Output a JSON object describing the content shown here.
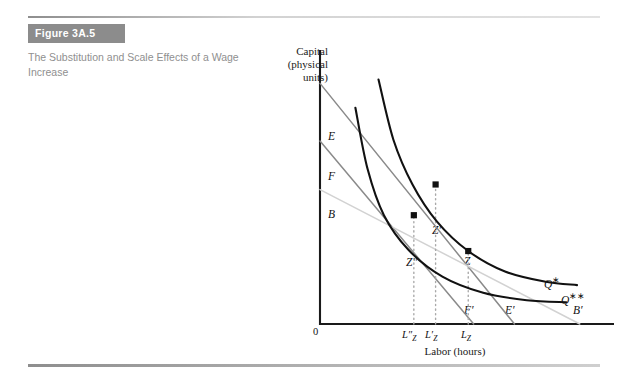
{
  "figure": {
    "badge": "Figure 3A.5",
    "caption": "The Substitution and Scale Effects of a Wage Increase"
  },
  "chart_data": {
    "type": "line",
    "title": "The Substitution and Scale Effects of a Wage Increase",
    "ylabel": "Capital\n(physical\nunits)",
    "ylabel_line1": "Capital",
    "ylabel_line2": "(physical",
    "ylabel_line3": "units)",
    "xlabel": "Labor (hours)",
    "origin_label": "0",
    "grid": false,
    "legend": "none",
    "axis_intercept_labels": [
      {
        "name": "E",
        "label": "E",
        "axis": "capital",
        "note": "highest isocost vertical intercept"
      },
      {
        "name": "F",
        "label": "F",
        "axis": "capital",
        "note": "middle isocost vertical intercept"
      },
      {
        "name": "B",
        "label": "B",
        "axis": "capital",
        "note": "flattest isocost vertical intercept"
      },
      {
        "name": "F-prime",
        "label": "F′",
        "axis": "labor",
        "note": "middle isocost horizontal intercept"
      },
      {
        "name": "E-prime",
        "label": "E′",
        "axis": "labor",
        "note": "highest isocost horizontal intercept"
      },
      {
        "name": "B-prime",
        "label": "B′",
        "axis": "labor",
        "note": "flattest isocost horizontal intercept"
      }
    ],
    "isoquant_labels": [
      {
        "name": "Q-star",
        "label": "Q✱",
        "text": "Q",
        "star": "∗",
        "note": "original isoquant"
      },
      {
        "name": "Q-double-star",
        "label": "Q✱✱",
        "text": "Q",
        "star": "∗∗",
        "note": "lower isoquant after scale effect"
      }
    ],
    "equilibrium_points": [
      {
        "name": "Z",
        "label": "Z",
        "labor": "L_Z",
        "note": "original cost-minimizing point on Q*"
      },
      {
        "name": "Z-prime",
        "label": "Z′",
        "labor": "L′_Z",
        "note": "substitution-effect point on Q*"
      },
      {
        "name": "Z-double-prime",
        "label": "Z″",
        "labor": "L″_Z",
        "note": "final point on Q**"
      }
    ],
    "x_tick_labels": [
      {
        "name": "L-double-prime-Z",
        "base": "L″",
        "sub": "Z"
      },
      {
        "name": "L-prime-Z",
        "base": "L′",
        "sub": "Z"
      },
      {
        "name": "L-Z",
        "base": "L",
        "sub": "Z"
      }
    ],
    "series": [
      {
        "name": "isoquant-Q-star",
        "label": "Q∗",
        "kind": "isoquant",
        "color": "#111111",
        "points": [
          [
            0.215,
            0.955
          ],
          [
            0.27,
            0.72
          ],
          [
            0.34,
            0.545
          ],
          [
            0.43,
            0.4
          ],
          [
            0.545,
            0.285
          ],
          [
            0.68,
            0.205
          ],
          [
            0.83,
            0.165
          ],
          [
            0.945,
            0.152
          ]
        ]
      },
      {
        "name": "isoquant-Q-double-star",
        "label": "Q∗∗",
        "kind": "isoquant",
        "color": "#111111",
        "points": [
          [
            0.13,
            0.845
          ],
          [
            0.175,
            0.605
          ],
          [
            0.235,
            0.425
          ],
          [
            0.325,
            0.29
          ],
          [
            0.45,
            0.185
          ],
          [
            0.6,
            0.122
          ],
          [
            0.76,
            0.093
          ],
          [
            0.905,
            0.085
          ]
        ]
      },
      {
        "name": "isocost-E-Eprime",
        "label": "E–E′",
        "kind": "isocost",
        "color": "#8a8a8a",
        "points": [
          [
            0.0,
            0.94
          ],
          [
            0.715,
            0.0
          ]
        ]
      },
      {
        "name": "isocost-F-Fprime",
        "label": "F–F′",
        "kind": "isocost",
        "color": "#8a8a8a",
        "points": [
          [
            0.0,
            0.715
          ],
          [
            0.565,
            0.0
          ]
        ]
      },
      {
        "name": "isocost-B-Bprime",
        "label": "B–B′",
        "kind": "isocost",
        "color": "#d2d2d2",
        "points": [
          [
            0.0,
            0.525
          ],
          [
            0.955,
            0.0
          ]
        ]
      }
    ],
    "annotations": [
      {
        "name": "dotted-drop-Ldblprime",
        "type": "vertical-dotted",
        "x": "L″_Z"
      },
      {
        "name": "dotted-drop-Lprime",
        "type": "vertical-dotted",
        "x": "L′_Z"
      },
      {
        "name": "dotted-drop-LZ",
        "type": "vertical-dotted",
        "x": "L_Z"
      }
    ]
  }
}
